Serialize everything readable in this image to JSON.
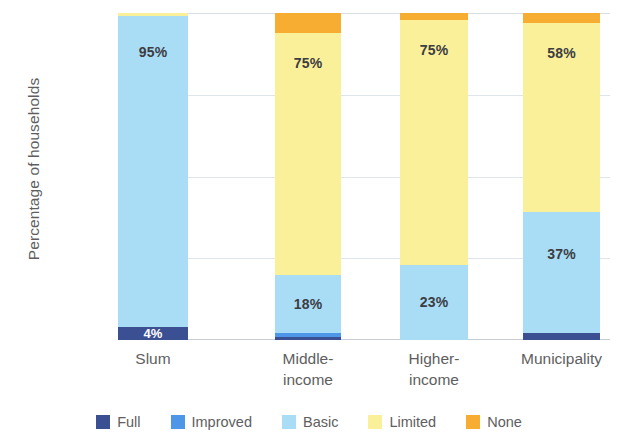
{
  "chart_data": {
    "type": "bar",
    "subtype": "stacked-bar-100-percent",
    "title": "",
    "xlabel": "",
    "ylabel": "Percentage of households",
    "ylim": [
      0,
      100
    ],
    "yticks": [
      0,
      25,
      50,
      75,
      100
    ],
    "ytick_labels": [
      "0%",
      "25%",
      "50%",
      "75%",
      "100%"
    ],
    "grid": true,
    "legend_position": "bottom",
    "categories": [
      "Slum",
      "Middle-income",
      "Higher-income",
      "Municipality"
    ],
    "category_labels": [
      "Slum",
      "Middle-\nincome",
      "Higher-\nincome",
      "Municipality"
    ],
    "series": [
      {
        "name": "Full",
        "color": "#3b4f93",
        "values": [
          4,
          1,
          0,
          2
        ]
      },
      {
        "name": "Improved",
        "color": "#4e97e8",
        "values": [
          0,
          1,
          0,
          0
        ]
      },
      {
        "name": "Basic",
        "color": "#a9ddf5",
        "values": [
          95,
          18,
          23,
          37
        ]
      },
      {
        "name": "Limited",
        "color": "#fbf09a",
        "values": [
          1,
          74,
          75,
          58
        ]
      },
      {
        "name": "None",
        "color": "#f6ad31",
        "values": [
          0,
          6,
          2,
          3
        ]
      }
    ],
    "data_labels": [
      {
        "category": "Slum",
        "series": "Basic",
        "text": "95%"
      },
      {
        "category": "Slum",
        "series": "Full",
        "text": "4%"
      },
      {
        "category": "Middle-income",
        "series": "Limited",
        "text": "75%"
      },
      {
        "category": "Middle-income",
        "series": "Basic",
        "text": "18%"
      },
      {
        "category": "Higher-income",
        "series": "Limited",
        "text": "75%"
      },
      {
        "category": "Higher-income",
        "series": "Basic",
        "text": "23%"
      },
      {
        "category": "Municipality",
        "series": "Limited",
        "text": "58%"
      },
      {
        "category": "Municipality",
        "series": "Basic",
        "text": "37%"
      }
    ]
  },
  "legend": {
    "items": [
      {
        "label": "Full",
        "color": "#3b4f93"
      },
      {
        "label": "Improved",
        "color": "#4e97e8"
      },
      {
        "label": "Basic",
        "color": "#a9ddf5"
      },
      {
        "label": "Limited",
        "color": "#fbf09a"
      },
      {
        "label": "None",
        "color": "#f6ad31"
      }
    ]
  },
  "axes": {
    "y_title": "Percentage of households",
    "y_tick_labels": [
      "100%",
      "75%",
      "50%",
      "25%",
      "0%"
    ],
    "x_tick_labels": [
      "Slum",
      "Middle-\nincome",
      "Higher-\nincome",
      "Municipality"
    ]
  }
}
